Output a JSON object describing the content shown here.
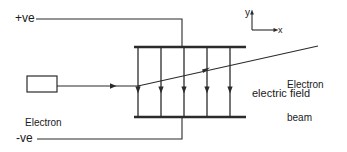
{
  "diagram": {
    "colors": {
      "stroke": "#2b2b2b",
      "text": "#1a1a1a",
      "background": "#ffffff"
    },
    "labels": {
      "positive_terminal": "+ve",
      "negative_terminal": "-ve",
      "electron_gun_line1": "Electron",
      "electron_gun_line2": "gun",
      "electron_beam_line1": "Electron",
      "electron_beam_line2": "beam",
      "electric_field": "electric field",
      "axis_y": "y",
      "axis_x": "x"
    },
    "components": {
      "electron_gun": {
        "name": "electron-gun-box",
        "x": 27,
        "y": 76,
        "width": 30,
        "height": 16
      },
      "top_plate": {
        "name": "top-deflecting-plate",
        "x1": 134,
        "y1": 47,
        "x2": 246,
        "y2": 47,
        "polarity": "+ve"
      },
      "bottom_plate": {
        "name": "bottom-deflecting-plate",
        "x1": 134,
        "y1": 117,
        "x2": 246,
        "y2": 117,
        "polarity": "-ve"
      },
      "field_lines": {
        "count": 5,
        "direction": "downward",
        "x_positions": [
          138,
          161,
          184,
          207,
          230
        ],
        "y_top": 47,
        "y_bottom": 117,
        "arrow_y": 92
      },
      "incoming_beam": {
        "name": "incoming-electron-beam",
        "x1": 57,
        "y1": 86,
        "x2": 138,
        "y2": 86,
        "arrow_x": 113
      },
      "deflected_beam": {
        "name": "deflected-electron-beam",
        "x1": 138,
        "y1": 86,
        "x2": 318,
        "y2": 46,
        "arrow_x": 208,
        "arrow_y": 70
      },
      "positive_wire": {
        "name": "positive-terminal-wire",
        "path": "M 36 19 L 182 19 L 182 47"
      },
      "negative_wire": {
        "name": "negative-terminal-wire",
        "path": "M 37 139 L 182 139 L 182 117"
      },
      "axes": {
        "name": "coordinate-axes",
        "origin_x": 252,
        "origin_y": 30,
        "y_tip": 10,
        "x_tip": 278
      }
    }
  }
}
